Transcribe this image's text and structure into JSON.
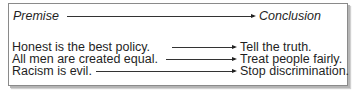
{
  "diagram": {
    "header": {
      "premise_label": "Premise",
      "conclusion_label": "Conclusion"
    },
    "rows": [
      {
        "premise": "Honest is the best policy.",
        "conclusion": "Tell the truth."
      },
      {
        "premise": "All men are created equal.",
        "conclusion": "Treat people fairly."
      },
      {
        "premise": "Racism is evil.",
        "conclusion": "Stop discrimination."
      }
    ],
    "colors": {
      "border": "#8a8a8a",
      "shadow": "#b5b5b5",
      "text": "#1f1f1f",
      "arrow": "#333333"
    }
  }
}
